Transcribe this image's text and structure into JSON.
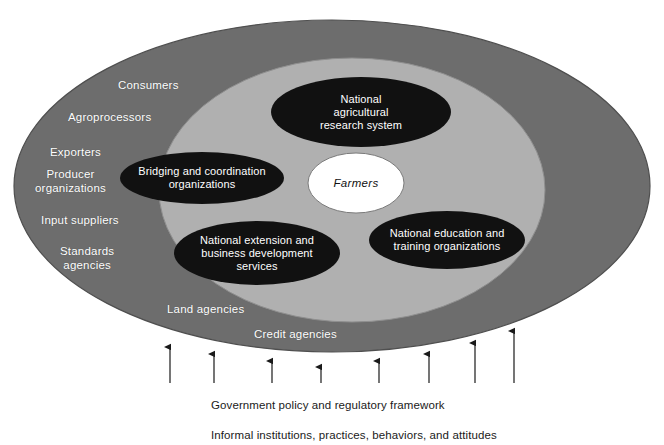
{
  "figure": {
    "colors": {
      "outer_ring": "#6d6d6d",
      "inner_ring": "#b0b0b0",
      "node_fill": "#111111",
      "center_fill": "#ffffff",
      "ring_label_text": "#ffffff",
      "node_label_text": "#ffffff",
      "caption_text": "#1a1a1a",
      "arrow": "#1a1a1a",
      "background": "#ffffff"
    }
  },
  "outer_ring": {
    "name": "outer-environment-ring",
    "labels": [
      {
        "text": "Consumers",
        "x": 118,
        "y": 79
      },
      {
        "text": "Agroprocessors",
        "x": 68,
        "y": 111
      },
      {
        "text": "Exporters",
        "x": 50,
        "y": 146
      },
      {
        "text": "Producer\norganizations",
        "x": 35,
        "y": 168
      },
      {
        "text": "Input suppliers",
        "x": 41,
        "y": 214
      },
      {
        "text": "Standards\nagencies",
        "x": 60,
        "y": 245
      },
      {
        "text": "Land agencies",
        "x": 167,
        "y": 303
      },
      {
        "text": "Credit agencies",
        "x": 254,
        "y": 328
      }
    ]
  },
  "inner_ring": {
    "name": "agricultural-innovation-core",
    "nodes": [
      {
        "id": "national-agricultural-research-system",
        "label": "National\nagricultural\nresearch system",
        "cx": 361,
        "cy": 112,
        "rx": 90,
        "ry": 35,
        "style": "dark"
      },
      {
        "id": "bridging-and-coordination-organizations",
        "label": "Bridging and coordination\norganizations",
        "cx": 202,
        "cy": 178,
        "rx": 82,
        "ry": 26,
        "style": "dark"
      },
      {
        "id": "farmers",
        "label": "Farmers",
        "cx": 356,
        "cy": 183,
        "rx": 48,
        "ry": 30,
        "style": "center"
      },
      {
        "id": "national-extension-and-business-development-services",
        "label": "National extension and\nbusiness development\nservices",
        "cx": 257,
        "cy": 253,
        "rx": 83,
        "ry": 32,
        "style": "dark"
      },
      {
        "id": "national-education-and-training-organizations",
        "label": "National education and\ntraining organizations",
        "cx": 447,
        "cy": 240,
        "rx": 78,
        "ry": 29,
        "style": "dark"
      }
    ]
  },
  "arrows": {
    "name": "upward-influence-arrows",
    "items": [
      {
        "x": 170,
        "tip_y": 347,
        "bottom_y": 383
      },
      {
        "x": 214,
        "tip_y": 354,
        "bottom_y": 383
      },
      {
        "x": 272,
        "tip_y": 361,
        "bottom_y": 383
      },
      {
        "x": 321,
        "tip_y": 367,
        "bottom_y": 383
      },
      {
        "x": 379,
        "tip_y": 361,
        "bottom_y": 383
      },
      {
        "x": 429,
        "tip_y": 354,
        "bottom_y": 383
      },
      {
        "x": 475,
        "tip_y": 343,
        "bottom_y": 383
      },
      {
        "x": 514,
        "tip_y": 331,
        "bottom_y": 383
      }
    ]
  },
  "caption": {
    "line1": "Government policy and regulatory framework",
    "line2": "Informal institutions, practices, behaviors, and attitudes"
  }
}
